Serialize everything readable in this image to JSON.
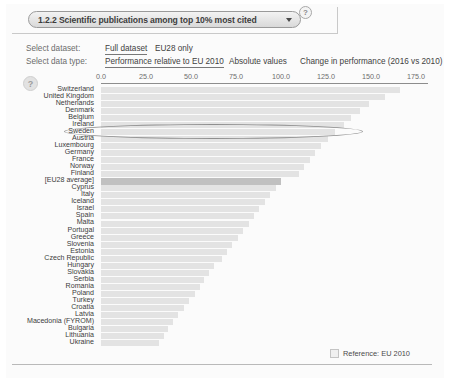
{
  "header": {
    "selected_indicator": "1.2.2 Scientific publications among top 10% most cited",
    "dropdown_arrow_icon": "chevron-down-icon",
    "help_icon": "question-mark-icon"
  },
  "controls": {
    "dataset_label": "Select dataset:",
    "datatype_label": "Select data type:",
    "dataset_options": [
      {
        "label": "Full dataset",
        "selected": true
      },
      {
        "label": "EU28 only",
        "selected": false
      }
    ],
    "datatype_options": [
      {
        "label": "Performance relative to EU 2010",
        "selected": true
      },
      {
        "label": "Absolute values",
        "selected": false
      },
      {
        "label": "Change in performance (2016 vs 2010)",
        "selected": false
      }
    ],
    "plot_help_icon": "question-mark-icon"
  },
  "legend": {
    "swatch_name": "reference-swatch",
    "text": "Reference: EU 2010"
  },
  "chart_data": {
    "type": "bar",
    "orientation": "horizontal",
    "title": "1.2.2 Scientific publications among top 10% most cited",
    "xlabel": "",
    "ylabel": "",
    "xlim": [
      0,
      180
    ],
    "tick_labels": [
      "0.0",
      "25.0",
      "50.0",
      "75.0",
      "100.0",
      "125.0",
      "150.0",
      "175.0"
    ],
    "tick_values": [
      0,
      25,
      50,
      75,
      100,
      125,
      150,
      175
    ],
    "grid": false,
    "legend_position": "bottom-right",
    "reference_series": "Reference: EU 2010",
    "annotation": {
      "type": "ellipse",
      "target": "Ireland",
      "name": "ireland-highlight-ellipse"
    },
    "categories": [
      "Switzerland",
      "United Kingdom",
      "Netherlands",
      "Denmark",
      "Belgium",
      "Ireland",
      "Sweden",
      "Austria",
      "Luxembourg",
      "Germany",
      "France",
      "Norway",
      "Finland",
      "[EU28 average]",
      "Cyprus",
      "Italy",
      "Iceland",
      "Israel",
      "Spain",
      "Malta",
      "Portugal",
      "Greece",
      "Slovenia",
      "Estonia",
      "Czech Republic",
      "Hungary",
      "Slovakia",
      "Serbia",
      "Romania",
      "Poland",
      "Turkey",
      "Croatia",
      "Latvia",
      "Macedonia (FYROM)",
      "Bulgaria",
      "Lithuania",
      "Ukraine"
    ],
    "values": [
      166.0,
      158.0,
      149.0,
      144.0,
      139.0,
      135.0,
      130.0,
      126.0,
      122.0,
      119.0,
      116.0,
      113.0,
      110.0,
      100.0,
      97.0,
      94.0,
      91.0,
      88.0,
      85.0,
      82.0,
      79.0,
      76.0,
      73.0,
      70.0,
      67.0,
      63.0,
      60.0,
      57.0,
      55.0,
      52.0,
      49.0,
      46.0,
      43.0,
      40.0,
      37.0,
      35.0,
      32.0
    ],
    "highlight_category": "[EU28 average]"
  }
}
